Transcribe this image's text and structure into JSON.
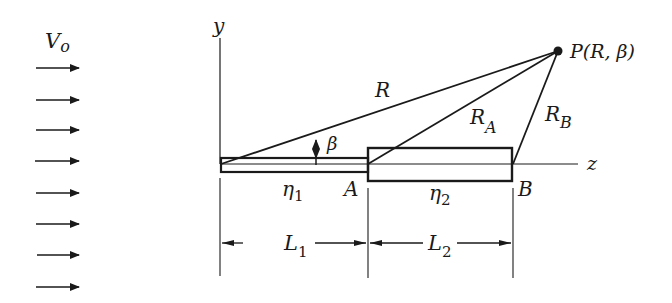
{
  "figure": {
    "type": "schematic",
    "flow": {
      "label": "V",
      "label_sub": "o",
      "arrow_count": 8,
      "arrow_y": [
        68,
        100,
        130,
        161,
        192,
        224,
        255,
        287
      ]
    },
    "axes": {
      "y_label": "y",
      "z_label": "z"
    },
    "point_P": {
      "label": "P(R, β)"
    },
    "lines": {
      "R": "R",
      "RA": "R",
      "RA_sub": "A",
      "RB": "R",
      "RB_sub": "B"
    },
    "angle": {
      "label": "β"
    },
    "segments": {
      "eta1": "η",
      "eta1_sub": "1",
      "eta2": "η",
      "eta2_sub": "2",
      "A": "A",
      "B": "B"
    },
    "dimensions": {
      "L1": "L",
      "L1_sub": "1",
      "L2": "L",
      "L2_sub": "2"
    },
    "colors": {
      "stroke": "#1a1a1a",
      "background": "#ffffff"
    }
  }
}
